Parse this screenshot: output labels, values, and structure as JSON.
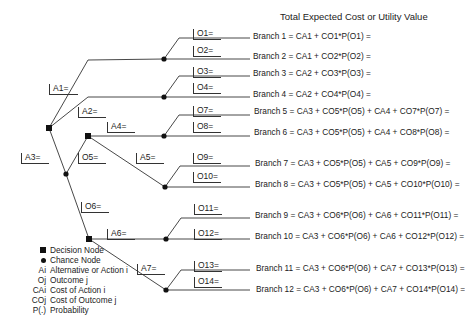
{
  "header": {
    "title": "Total Expected Cost or Utility Value"
  },
  "labels": {
    "A1": "A1=",
    "A2": "A2=",
    "A3": "A3=",
    "A4": "A4=",
    "A5": "A5=",
    "A6": "A6=",
    "A7": "A7=",
    "O1": "O1=",
    "O2": "O2=",
    "O3": "O3=",
    "O4": "O4=",
    "O5": "O5=",
    "O6": "O6=",
    "O7": "O7=",
    "O8": "O8=",
    "O9": "O9=",
    "O10": "O10=",
    "O11": "O11=",
    "O12": "O12=",
    "O13": "O13=",
    "O14": "O14="
  },
  "branches": [
    "Branch 1 = CA1 + CO1*P(O1) =",
    "Branch 2 = CA1 + CO2*P(O2) =",
    "Branch 3 = CA2 + CO3*P(O3) =",
    "Branch 4 = CA2 + CO4*P(O4) =",
    "Branch 5 = CA3 + CO5*P(O5) + CA4 + CO7*P(O7) =",
    "Branch 6 = CA3 + CO5*P(O5) + CA4 + CO8*P(O8) =",
    "Branch 7 = CA3 + CO5*P(O5) + CA5 + CO9*P(O9) =",
    "Branch 8 = CA3 + CO5*P(O5) + CA5 + CO10*P(O10) =",
    "Branch 9 = CA3 + CO6*P(O6) + CA6 + CO11*P(O11) =",
    "Branch 10 = CA3 + CO6*P(O6) + CA6 + CO12*P(O12) =",
    "Branch 11 = CA3 + CO6*P(O6) + CA7 + CO13*P(O13) =",
    "Branch 12 = CA3 + CO6*P(O6) + CA7 + CO14*P(O14) ="
  ],
  "legend": [
    {
      "key": "",
      "symbol": "decision-node",
      "text": "Decision Node"
    },
    {
      "key": "",
      "symbol": "chance-node",
      "text": "Chance Node"
    },
    {
      "key": "Ai",
      "text": "Alternative or Action i"
    },
    {
      "key": "Oj",
      "text": "Outcome j"
    },
    {
      "key": "CAi",
      "text": "Cost of Action i"
    },
    {
      "key": "COj",
      "text": "Cost of Outcome j"
    },
    {
      "key": "P(.)",
      "text": "Probability"
    }
  ]
}
